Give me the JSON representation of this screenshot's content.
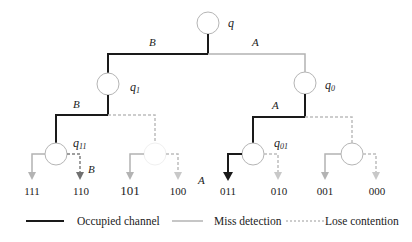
{
  "colors": {
    "occupied": "#1a1a1a",
    "miss": "#b3b3b3",
    "lose": "#bdbdbd",
    "node_stroke": "#b5b5b5",
    "text": "#222222"
  },
  "nodes": {
    "root": {
      "label": "q",
      "sub": ""
    },
    "q1": {
      "label": "q",
      "sub": "1"
    },
    "q0": {
      "label": "q",
      "sub": "0"
    },
    "q11": {
      "label": "q",
      "sub": "11"
    },
    "q01": {
      "label": "q",
      "sub": "01"
    }
  },
  "edge_labels": {
    "root_left": "B",
    "root_right": "A",
    "q1_left": "B",
    "q0_left": "A",
    "q11_right": "B",
    "q10_right": "A"
  },
  "leaves": [
    "111",
    "110",
    "101",
    "100",
    "011",
    "010",
    "001",
    "000"
  ],
  "legend": {
    "occupied": "Occupied channel",
    "miss": "Miss detection",
    "lose": "Lose contention"
  }
}
